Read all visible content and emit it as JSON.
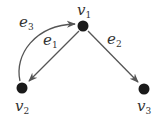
{
  "diagram": {
    "type": "directed-graph",
    "colors": {
      "node": "#1a1a1a",
      "edge": "#555555",
      "label": "#333333"
    },
    "nodes": [
      {
        "id": "v1",
        "name": "v",
        "sub": "1",
        "x": 83,
        "y": 26
      },
      {
        "id": "v2",
        "name": "v",
        "sub": "2",
        "x": 22,
        "y": 88
      },
      {
        "id": "v3",
        "name": "v",
        "sub": "3",
        "x": 144,
        "y": 89
      }
    ],
    "edges": [
      {
        "id": "e1",
        "name": "e",
        "sub": "1",
        "from": "v1",
        "to": "v2",
        "shape": "straight"
      },
      {
        "id": "e2",
        "name": "e",
        "sub": "2",
        "from": "v1",
        "to": "v3",
        "shape": "straight"
      },
      {
        "id": "e3",
        "name": "e",
        "sub": "3",
        "from": "v2",
        "to": "v1",
        "shape": "curved"
      }
    ]
  }
}
